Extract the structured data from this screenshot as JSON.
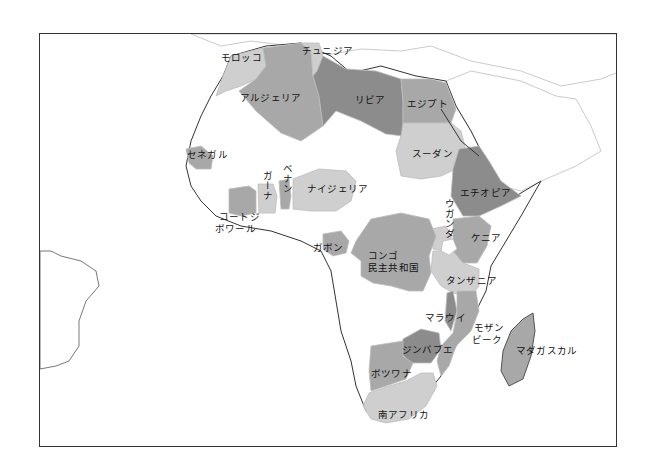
{
  "map": {
    "title": "",
    "region": "Africa",
    "colors": {
      "dark": "#8c8c8c",
      "medium": "#a8a8a8",
      "light": "#cfcfcf",
      "none": "#ffffff",
      "border": "#bdbdbd",
      "coast": "#333333"
    },
    "countries": [
      {
        "id": "morocco",
        "label": "モロッコ",
        "shade": "light"
      },
      {
        "id": "tunisia",
        "label": "チュニジア",
        "shade": "light"
      },
      {
        "id": "algeria",
        "label": "アルジェリア",
        "shade": "medium"
      },
      {
        "id": "libya",
        "label": "リビア",
        "shade": "dark"
      },
      {
        "id": "egypt",
        "label": "エジプト",
        "shade": "medium"
      },
      {
        "id": "sudan",
        "label": "スーダン",
        "shade": "light"
      },
      {
        "id": "senegal",
        "label": "セネガル",
        "shade": "medium"
      },
      {
        "id": "ghana",
        "label": "ガーナ",
        "shade": "light"
      },
      {
        "id": "benin",
        "label": "ベナン",
        "shade": "medium"
      },
      {
        "id": "nigeria",
        "label": "ナイジェリア",
        "shade": "light"
      },
      {
        "id": "cote-divoire",
        "label": "コートジボワール",
        "label_line1": "コートジ",
        "label_line2": "ボワール",
        "shade": "medium"
      },
      {
        "id": "ethiopia",
        "label": "エチオピア",
        "shade": "dark"
      },
      {
        "id": "uganda",
        "label": "ウガンダ",
        "shade": "light"
      },
      {
        "id": "kenya",
        "label": "ケニア",
        "shade": "medium"
      },
      {
        "id": "gabon",
        "label": "ガボン",
        "shade": "medium"
      },
      {
        "id": "drc",
        "label": "コンゴ民主共和国",
        "label_line1": "コンゴ",
        "label_line2": "民主共和国",
        "shade": "medium"
      },
      {
        "id": "tanzania",
        "label": "タンザニア",
        "shade": "light"
      },
      {
        "id": "malawi",
        "label": "マラウイ",
        "shade": "dark"
      },
      {
        "id": "mozambique",
        "label": "モザンビーク",
        "label_line1": "モザン",
        "label_line2": "ビーク",
        "shade": "medium"
      },
      {
        "id": "zimbabwe",
        "label": "ジンバブエ",
        "shade": "dark"
      },
      {
        "id": "botswana",
        "label": "ボツワナ",
        "shade": "medium"
      },
      {
        "id": "south-africa",
        "label": "南アフリカ",
        "shade": "light"
      },
      {
        "id": "madagascar",
        "label": "マダガスカル",
        "shade": "medium"
      }
    ]
  }
}
